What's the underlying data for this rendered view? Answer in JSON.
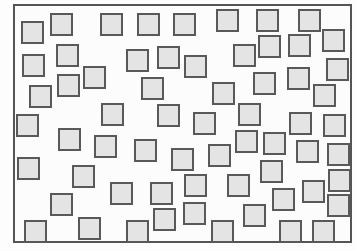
{
  "figure": {
    "frame": {
      "left": 13,
      "top": 4,
      "width": 339,
      "height": 239,
      "border_color": "#555555"
    },
    "square_size": 23,
    "square_fill": "#e4e4e4",
    "square_border": "#595959",
    "square_count": 63,
    "squares": [
      [
        21,
        21
      ],
      [
        50,
        13
      ],
      [
        100,
        13
      ],
      [
        137,
        13
      ],
      [
        173,
        13
      ],
      [
        216,
        9
      ],
      [
        256,
        9
      ],
      [
        298,
        9
      ],
      [
        22,
        54
      ],
      [
        56,
        44
      ],
      [
        126,
        49
      ],
      [
        157,
        46
      ],
      [
        184,
        55
      ],
      [
        233,
        44
      ],
      [
        258,
        35
      ],
      [
        288,
        34
      ],
      [
        322,
        29
      ],
      [
        83,
        66
      ],
      [
        57,
        74
      ],
      [
        29,
        85
      ],
      [
        141,
        77
      ],
      [
        212,
        82
      ],
      [
        253,
        72
      ],
      [
        287,
        67
      ],
      [
        326,
        58
      ],
      [
        313,
        84
      ],
      [
        16,
        114
      ],
      [
        101,
        103
      ],
      [
        157,
        104
      ],
      [
        193,
        112
      ],
      [
        238,
        103
      ],
      [
        289,
        112
      ],
      [
        323,
        114
      ],
      [
        58,
        128
      ],
      [
        94,
        135
      ],
      [
        134,
        139
      ],
      [
        171,
        148
      ],
      [
        208,
        144
      ],
      [
        235,
        130
      ],
      [
        263,
        132
      ],
      [
        296,
        140
      ],
      [
        327,
        143
      ],
      [
        17,
        157
      ],
      [
        72,
        165
      ],
      [
        110,
        182
      ],
      [
        150,
        182
      ],
      [
        184,
        174
      ],
      [
        227,
        174
      ],
      [
        260,
        160
      ],
      [
        302,
        180
      ],
      [
        328,
        169
      ],
      [
        50,
        193
      ],
      [
        153,
        208
      ],
      [
        183,
        202
      ],
      [
        243,
        204
      ],
      [
        272,
        188
      ],
      [
        327,
        194
      ],
      [
        24,
        220
      ],
      [
        78,
        217
      ],
      [
        126,
        220
      ],
      [
        211,
        220
      ],
      [
        279,
        220
      ],
      [
        312,
        220
      ]
    ]
  }
}
